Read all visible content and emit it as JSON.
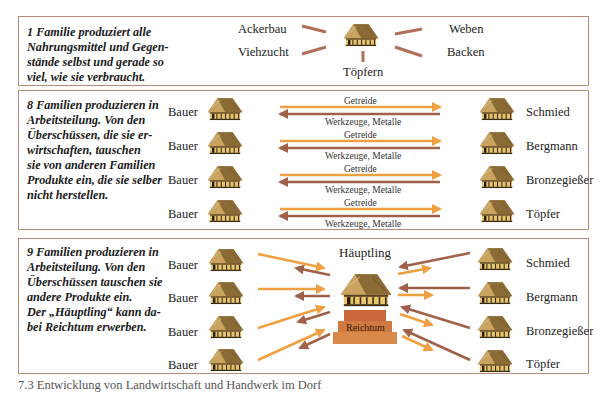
{
  "panel1": {
    "description": "1 Familie produziert alle Nahrungsmittel und Gegen-stände selbst und gerade so viel, wie sie verbraucht.",
    "desc_lines": [
      "1 Familie produziert alle",
      "Nahrungsmittel und Gegen-",
      "stände selbst und gerade so",
      "viel, wie sie verbraucht."
    ],
    "activities": {
      "top_left": "Ackerbau",
      "bottom_left": "Viehzucht",
      "bottom": "Töpfern",
      "top_right": "Weben",
      "bottom_right": "Backen"
    }
  },
  "panel2": {
    "desc_lines": [
      "8 Familien produzieren in",
      "Arbeitsteilung. Von den",
      "Überschüssen, die sie er-",
      "wirtschaften, tauschen",
      "sie von anderen Familien",
      "Produkte ein, die sie selber",
      "nicht herstellen."
    ],
    "rows": [
      {
        "left": "Bauer",
        "right": "Schmied",
        "to_right": "Getreide",
        "to_left": "Werkzeuge, Metalle"
      },
      {
        "left": "Bauer",
        "right": "Bergmann",
        "to_right": "Getreide",
        "to_left": "Werkzeuge, Metalle"
      },
      {
        "left": "Bauer",
        "right": "Bronzegießer",
        "to_right": "Getreide",
        "to_left": "Werkzeuge, Metalle"
      },
      {
        "left": "Bauer",
        "right": "Töpfer",
        "to_right": "Getreide",
        "to_left": "Werkzeuge, Metalle"
      }
    ]
  },
  "panel3": {
    "desc_lines": [
      "9 Familien produzieren in",
      "Arbeitsteilung. Von den",
      "Überschüssen tauschen sie",
      "andere Produkte ein.",
      "Der „Häuptling“ kann da-",
      "bei Reichtum erwerben."
    ],
    "center_label": "Häuptling",
    "wealth_label": "Reichtum",
    "left": [
      "Bauer",
      "Bauer",
      "Bauer",
      "Bauer"
    ],
    "right": [
      "Schmied",
      "Bergmann",
      "Bronzegießer",
      "Töpfer"
    ]
  },
  "caption": "7.3 Entwicklung von Landwirtschaft und Handwerk im Dorf",
  "colors": {
    "orange_arrow": "#f0a040",
    "brown_arrow": "#a0604a",
    "border": "#b78a7a",
    "spoke": "#b0705a",
    "wealth": "#d07a40"
  }
}
